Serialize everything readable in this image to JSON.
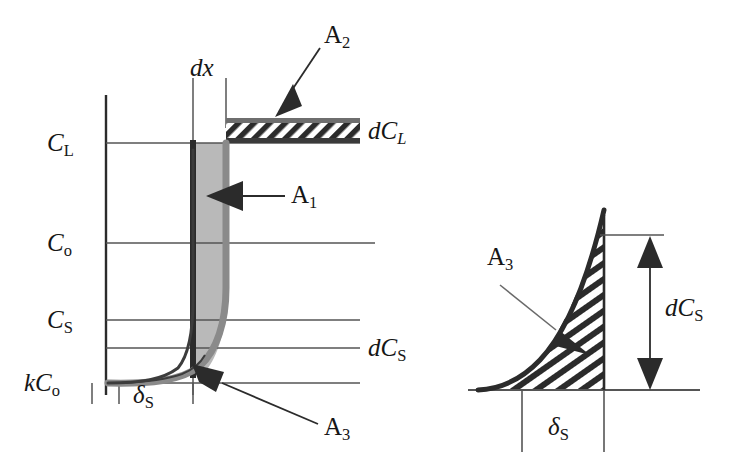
{
  "figure": {
    "type": "scientific-diagram",
    "background_color": "#ffffff",
    "ink_color": "#222222",
    "gray_fill_color": "#b9b9b9",
    "gray_curve_color": "#8a8a8a"
  },
  "main_plot": {
    "y_axis_labels": [
      {
        "id": "C_L",
        "text_main": "C",
        "text_sub": "L",
        "value_y": 143
      },
      {
        "id": "C_o",
        "text_main": "C",
        "text_sub": "o",
        "value_y": 243
      },
      {
        "id": "C_S",
        "text_main": "C",
        "text_sub": "S",
        "value_y": 320
      },
      {
        "id": "kC_o",
        "text_main": "kC",
        "text_sub": "o",
        "value_y": 383
      }
    ],
    "right_labels": [
      {
        "id": "dC_L",
        "text_main": "dC",
        "text_sub": "L"
      },
      {
        "id": "dC_S",
        "text_main": "dC",
        "text_sub": "S"
      }
    ],
    "x_axis_label": {
      "id": "delta_S",
      "text_main": "δ",
      "text_sub": "S"
    },
    "dx_label": "dx",
    "area_labels": [
      {
        "id": "A1",
        "text_main": "A",
        "text_sub": "1"
      },
      {
        "id": "A2",
        "text_main": "A",
        "text_sub": "2"
      },
      {
        "id": "A3",
        "text_main": "A",
        "text_sub": "3"
      }
    ]
  },
  "inset_plot": {
    "area_label": {
      "id": "A3",
      "text_main": "A",
      "text_sub": "3"
    },
    "vertical_dimension": {
      "id": "dC_S",
      "text_main": "dC",
      "text_sub": "S"
    },
    "horizontal_dimension": {
      "id": "delta_S",
      "text_main": "δ",
      "text_sub": "S"
    },
    "hatch_pattern": "diagonal-lines"
  }
}
